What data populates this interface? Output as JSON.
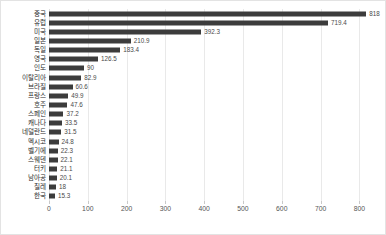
{
  "chart_data": {
    "type": "bar",
    "orientation": "horizontal",
    "title": "",
    "subtitle": "",
    "xlabel": "",
    "ylabel": "",
    "xlim": [
      0,
      830
    ],
    "ticks": [
      0,
      100,
      200,
      300,
      400,
      500,
      600,
      700,
      800
    ],
    "tick_labels": [
      "0",
      "100",
      "200",
      "300",
      "400",
      "500",
      "600",
      "700",
      "800"
    ],
    "grid": true,
    "legend": false,
    "bar_color": "#3c3c3c",
    "grid_color": "#e9e9e9",
    "categories": [
      "중국",
      "유럽",
      "미국",
      "일본",
      "독일",
      "영국",
      "인도",
      "이탈리아",
      "브라질",
      "프랑스",
      "호주",
      "스페인",
      "캐나다",
      "네덜란드",
      "멕시코",
      "벨기에",
      "스웨덴",
      "터키",
      "남아공",
      "칠레",
      "한국"
    ],
    "values": [
      818,
      719.4,
      392.3,
      210.9,
      183.4,
      126.5,
      90,
      82.9,
      60.6,
      49.9,
      47.6,
      37.2,
      33.5,
      31.5,
      24.8,
      22.3,
      22.1,
      21.1,
      20.1,
      18,
      15.3
    ],
    "value_labels": [
      "818",
      "719.4",
      "392.3",
      "210.9",
      "183.4",
      "126.5",
      "90",
      "82.9",
      "60.6",
      "49.9",
      "47.6",
      "37.2",
      "33.5",
      "31.5",
      "24.8",
      "22.3",
      "22.1",
      "21.1",
      "20.1",
      "18",
      "15.3"
    ]
  }
}
